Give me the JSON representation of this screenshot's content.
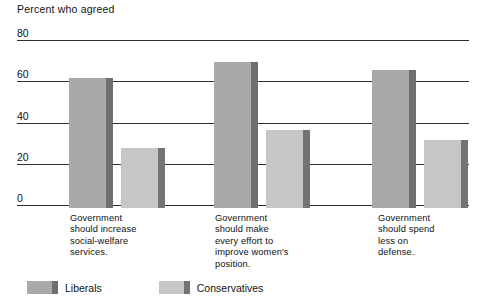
{
  "chart_data": {
    "type": "bar",
    "title": "Percent who agreed",
    "xlabel": "",
    "ylabel": "",
    "ylim": [
      0,
      80
    ],
    "yticks": [
      0,
      20,
      40,
      60,
      80
    ],
    "ytick_labels": [
      "0",
      "20",
      "40",
      "60",
      "80"
    ],
    "grid": true,
    "legend_position": "bottom-left",
    "categories": [
      "Government should increase social-welfare services.",
      "Government should make every effort to improve women's position.",
      "Government should spend less on defense."
    ],
    "category_lines": [
      [
        "Government",
        "should increase",
        "social-welfare",
        "services."
      ],
      [
        "Government",
        "should make",
        "every effort to",
        "improve women's",
        "position."
      ],
      [
        "Government",
        "should spend",
        "less on",
        "defense."
      ]
    ],
    "series": [
      {
        "name": "Liberals",
        "color": "#a9a9a9",
        "side_color": "#6e6e6e",
        "values": [
          63,
          71,
          67
        ]
      },
      {
        "name": "Conservatives",
        "color": "#c6c6c6",
        "side_color": "#737373",
        "values": [
          29,
          38,
          33
        ]
      }
    ]
  },
  "legend": {
    "items": [
      {
        "label": "Liberals"
      },
      {
        "label": "Conservatives"
      }
    ]
  },
  "colors": {
    "background": "#ffffff",
    "axis": "#2e2e2e",
    "text": "#111111",
    "liberals": "#a9a9a9",
    "liberals_shadow": "#6e6e6e",
    "conservatives": "#c6c6c6",
    "conservatives_shadow": "#737373"
  }
}
